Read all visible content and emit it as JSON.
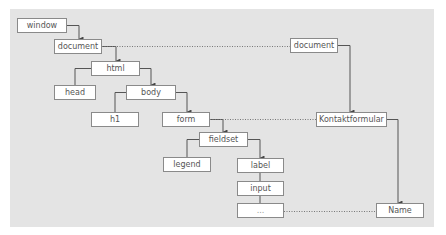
{
  "diagram": {
    "type": "DOM tree mapping",
    "left_tree": {
      "nodes": {
        "window": "window",
        "document": "document",
        "html": "html",
        "head": "head",
        "body": "body",
        "h1": "h1",
        "form": "form",
        "fieldset": "fieldset",
        "legend": "legend",
        "label": "label",
        "input": "input",
        "ellipsis": "..."
      }
    },
    "right_tree": {
      "nodes": {
        "document": "document",
        "kontaktformular": "Kontaktformular",
        "name": "Name"
      }
    },
    "edges": [
      {
        "from": "window",
        "to": "document",
        "style": "arrow"
      },
      {
        "from": "document",
        "to": "html",
        "style": "arrow"
      },
      {
        "from": "html",
        "to": "head",
        "style": "line"
      },
      {
        "from": "html",
        "to": "body",
        "style": "arrow"
      },
      {
        "from": "body",
        "to": "h1",
        "style": "line"
      },
      {
        "from": "body",
        "to": "form",
        "style": "arrow"
      },
      {
        "from": "form",
        "to": "fieldset",
        "style": "arrow"
      },
      {
        "from": "fieldset",
        "to": "legend",
        "style": "line"
      },
      {
        "from": "fieldset",
        "to": "label",
        "style": "arrow"
      },
      {
        "from": "label",
        "to": "input",
        "style": "line"
      },
      {
        "from": "input",
        "to": "...",
        "style": "line"
      },
      {
        "from": "document (right)",
        "to": "Kontaktformular",
        "style": "arrow"
      },
      {
        "from": "Kontaktformular",
        "to": "Name",
        "style": "arrow"
      },
      {
        "from": "document",
        "to": "document (right)",
        "style": "dotted"
      },
      {
        "from": "form",
        "to": "Kontaktformular",
        "style": "dotted"
      },
      {
        "from": "...",
        "to": "Name",
        "style": "dotted"
      }
    ],
    "colors": {
      "panel": "#e4e4e4",
      "box_fill": "#ffffff",
      "box_border": "#8a8a8a",
      "line": "#555555",
      "text": "#555555"
    }
  }
}
